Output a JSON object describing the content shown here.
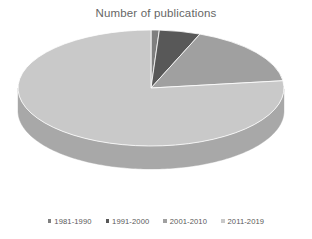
{
  "chart_data": {
    "type": "pie",
    "title": "Number of publications",
    "subtitle": "",
    "xlabel": "",
    "ylabel": "",
    "three_d": true,
    "grid": false,
    "legend_position": "bottom",
    "start_angle_deg": 0,
    "direction": "clockwise",
    "categories": [
      "1981-1990",
      "1991-2000",
      "2001-2010",
      "2011-2019"
    ],
    "values": [
      1,
      5,
      17,
      77
    ],
    "percentages": [
      "1%",
      "5%",
      "17%",
      "77%"
    ],
    "slice_angles_deg": [
      3.6,
      18,
      61.2,
      277.2
    ],
    "colors": [
      "#7f7f7f",
      "#585858",
      "#a0a0a0",
      "#c9c9c9"
    ],
    "side_colors": [
      "#5c5c5c",
      "#3d3d3d",
      "#737373",
      "#a8a8a8"
    ],
    "series": [
      {
        "name": "Number of publications",
        "values": [
          1,
          5,
          17,
          77
        ]
      }
    ],
    "slices": [
      {
        "label": "1981-1990",
        "value": 1,
        "percent": "1%",
        "color": "#7f7f7f",
        "side_color": "#5c5c5c"
      },
      {
        "label": "1991-2000",
        "value": 5,
        "percent": "5%",
        "color": "#585858",
        "side_color": "#3d3d3d"
      },
      {
        "label": "2001-2010",
        "value": 17,
        "percent": "17%",
        "color": "#a0a0a0",
        "side_color": "#737373"
      },
      {
        "label": "2011-2019",
        "value": 77,
        "percent": "77%",
        "color": "#c9c9c9",
        "side_color": "#a8a8a8"
      }
    ]
  },
  "title": {
    "text": "Number of publications",
    "color": "#666666"
  },
  "legend": {
    "marker_icon": "square-marker-icon",
    "items": [
      {
        "label": "1981-1990",
        "color": "#7f7f7f"
      },
      {
        "label": "1991-2000",
        "color": "#585858"
      },
      {
        "label": "2001-2010",
        "color": "#a0a0a0"
      },
      {
        "label": "2011-2019",
        "color": "#c9c9c9"
      }
    ]
  },
  "canvas": {
    "background": "#ffffff"
  }
}
